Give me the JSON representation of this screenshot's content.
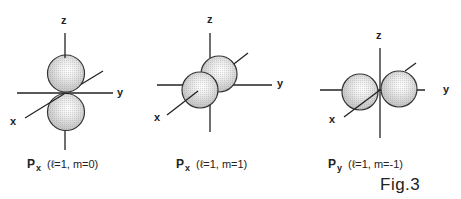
{
  "figure": {
    "label": "Fig.3",
    "panels": [
      {
        "id": "panel-1",
        "orbital_symbol": "P",
        "orbital_subscript": "x",
        "quantum_numbers": "(ℓ=1, m=0)",
        "lobe_orientation": "along z-axis",
        "axes": {
          "z": "z",
          "y": "y",
          "x": "x"
        }
      },
      {
        "id": "panel-2",
        "orbital_symbol": "P",
        "orbital_subscript": "x",
        "quantum_numbers": "(ℓ=1, m=1)",
        "lobe_orientation": "along x-axis",
        "axes": {
          "z": "z",
          "y": "y",
          "x": "x"
        }
      },
      {
        "id": "panel-3",
        "orbital_symbol": "P",
        "orbital_subscript": "y",
        "quantum_numbers": "(ℓ=1, m=-1)",
        "lobe_orientation": "along y-axis",
        "axes": {
          "z": "z",
          "y": "y",
          "x": "x"
        }
      }
    ],
    "colors": {
      "lobe_fill": "#cdcdcd",
      "lobe_highlight": "#ffffff",
      "lobe_stroke": "#333333",
      "axis": "#222222"
    }
  }
}
